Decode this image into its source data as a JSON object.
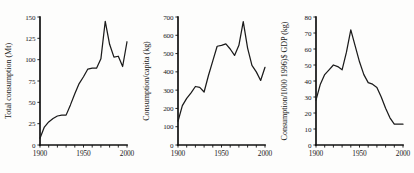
{
  "figure": {
    "panel_count": 3,
    "background_color": "#fdfdfc",
    "line_color": "#1b1b1b",
    "axis_color": "#111111"
  },
  "chart_data": [
    {
      "type": "line",
      "title": "",
      "xlabel": "",
      "ylabel": "Total consumption (Mt)",
      "xlim": [
        1900,
        2000
      ],
      "ylim": [
        0,
        150
      ],
      "grid": false,
      "legend": "none",
      "xticks": [
        1900,
        1910,
        1920,
        1930,
        1940,
        1950,
        1960,
        1970,
        1980,
        1990,
        2000
      ],
      "xtick_labels": [
        "1900",
        "",
        "",
        "",
        "",
        "1950",
        "",
        "",
        "",
        "",
        "2000"
      ],
      "yticks": [
        0,
        25,
        50,
        75,
        100,
        125,
        150
      ],
      "ytick_labels": [
        "0",
        "25",
        "50",
        "75",
        "100",
        "125",
        "150"
      ],
      "x": [
        1900,
        1905,
        1910,
        1915,
        1920,
        1925,
        1930,
        1935,
        1940,
        1945,
        1950,
        1955,
        1960,
        1965,
        1970,
        1975,
        1980,
        1985,
        1990,
        1995,
        2000
      ],
      "values": [
        8,
        21,
        27,
        31,
        34,
        35,
        35,
        47,
        60,
        72,
        80,
        89,
        90,
        90,
        101,
        145,
        118,
        103,
        104,
        92,
        121
      ]
    },
    {
      "type": "line",
      "title": "",
      "xlabel": "",
      "ylabel": "Consumption/capita (kg)",
      "xlim": [
        1900,
        2000
      ],
      "ylim": [
        0,
        700
      ],
      "grid": false,
      "legend": "none",
      "xticks": [
        1900,
        1910,
        1920,
        1930,
        1940,
        1950,
        1960,
        1970,
        1980,
        1990,
        2000
      ],
      "xtick_labels": [
        "1900",
        "",
        "",
        "",
        "",
        "1950",
        "",
        "",
        "",
        "",
        "2000"
      ],
      "yticks": [
        0,
        100,
        200,
        300,
        400,
        500,
        600,
        700
      ],
      "ytick_labels": [
        "0",
        "100",
        "200",
        "300",
        "400",
        "500",
        "600",
        "700"
      ],
      "x": [
        1900,
        1905,
        1910,
        1915,
        1920,
        1925,
        1930,
        1935,
        1940,
        1945,
        1950,
        1955,
        1960,
        1965,
        1970,
        1975,
        1980,
        1985,
        1990,
        1995,
        2000
      ],
      "values": [
        130,
        215,
        255,
        285,
        320,
        315,
        290,
        380,
        460,
        540,
        545,
        553,
        525,
        490,
        545,
        675,
        530,
        435,
        400,
        353,
        425
      ]
    },
    {
      "type": "line",
      "title": "",
      "xlabel": "",
      "ylabel": "Consumption/1000 1996)$ GDP (kg)",
      "xlim": [
        1900,
        2000
      ],
      "ylim": [
        0,
        80
      ],
      "grid": false,
      "legend": "none",
      "xticks": [
        1900,
        1910,
        1920,
        1930,
        1940,
        1950,
        1960,
        1970,
        1980,
        1990,
        2000
      ],
      "xtick_labels": [
        "1900",
        "",
        "",
        "",
        "",
        "1950",
        "",
        "",
        "",
        "",
        "2000"
      ],
      "yticks": [
        0,
        10,
        20,
        30,
        40,
        50,
        60,
        70,
        80
      ],
      "ytick_labels": [
        "0",
        "10",
        "20",
        "30",
        "40",
        "50",
        "60",
        "70",
        "80"
      ],
      "x": [
        1900,
        1905,
        1910,
        1915,
        1920,
        1925,
        1930,
        1935,
        1940,
        1945,
        1950,
        1955,
        1960,
        1965,
        1970,
        1975,
        1980,
        1985,
        1990,
        1995,
        2000
      ],
      "values": [
        28,
        38,
        44,
        47,
        50,
        49,
        47,
        58,
        72,
        62,
        52,
        44,
        39,
        38,
        36,
        30,
        23,
        17,
        13,
        13,
        13
      ]
    }
  ]
}
